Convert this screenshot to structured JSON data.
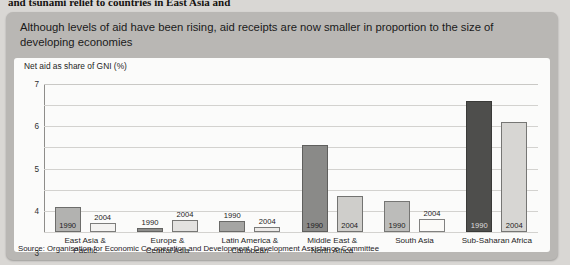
{
  "page": {
    "cut_off_text": "and tsunami relief to countries in East Asia and"
  },
  "figure": {
    "title": "Although levels of aid have been rising, aid receipts are now smaller in proportion to the size of developing economies",
    "source": "Source: Organisation for Economic Co-operation and Development, Development Assistance Committee",
    "panel_color": "#b9b7b4",
    "card_color": "#fbfbfa"
  },
  "chart_data": {
    "type": "bar",
    "title": "Although levels of aid have been rising, aid receipts are now smaller in proportion to the size of developing economies",
    "subtitle": "Net aid as share of GNI (%)",
    "xlabel": "",
    "ylabel": "Net aid as share of GNI (%)",
    "ylim": [
      0,
      7
    ],
    "yticks": [
      "0",
      "1",
      "2",
      "3",
      "4",
      "5",
      "6",
      "7"
    ],
    "grid": true,
    "legend": "inline data labels (year printed inside each bar)",
    "categories": [
      "East Asia & Pacific",
      "Europe & Central Asia",
      "Latin America & Caribbean",
      "Middle East & North Africa",
      "South Asia",
      "Sub-Saharan Africa"
    ],
    "category_lines": [
      [
        "East Asia &",
        "Pacific"
      ],
      [
        "Europe &",
        "Central Asia"
      ],
      [
        "Latin America &",
        "Caribbean"
      ],
      [
        "Middle East &",
        "North Africa"
      ],
      [
        "South Asia",
        ""
      ],
      [
        "Sub-Saharan Africa",
        ""
      ]
    ],
    "series": [
      {
        "name": "1990",
        "values": [
          1.2,
          0.2,
          0.5,
          4.1,
          1.45,
          6.2
        ]
      },
      {
        "name": "2004",
        "values": [
          0.45,
          0.55,
          0.25,
          1.7,
          0.6,
          5.2
        ]
      }
    ]
  }
}
